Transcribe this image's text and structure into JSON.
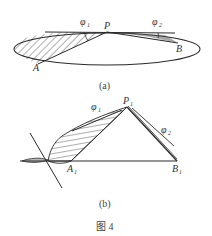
{
  "figure": {
    "caption": "图 4",
    "panel_a": {
      "label": "(a)",
      "points": {
        "P": "P",
        "A": "A",
        "B": "B"
      },
      "angles": {
        "phi1": "φ",
        "phi1_sub": "1",
        "phi2": "φ",
        "phi2_sub": "2"
      }
    },
    "panel_b": {
      "label": "(b)",
      "points": {
        "P1": "P",
        "P1_sub": "1",
        "A1": "A",
        "A1_sub": "1",
        "B1": "B",
        "B1_sub": "1"
      },
      "angles": {
        "phi1": "φ",
        "phi1_sub": "1",
        "phi2": "φ",
        "phi2_sub": "2"
      }
    },
    "colors": {
      "stroke": "#2a2a2a",
      "text": "#333333",
      "background": "#ffffff"
    }
  }
}
